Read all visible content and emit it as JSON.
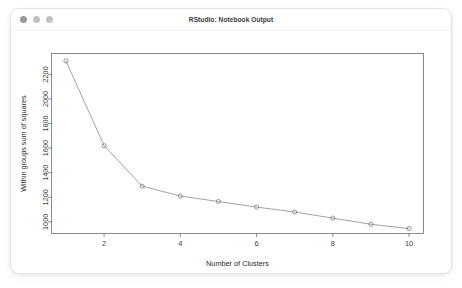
{
  "window": {
    "title": "RStudio: Notebook Output",
    "controls": [
      {
        "name": "close",
        "color": "#9a9a9e"
      },
      {
        "name": "minimize",
        "color": "#c2c2c6"
      },
      {
        "name": "maximize",
        "color": "#c2c2c6"
      }
    ]
  },
  "chart_data": {
    "type": "line",
    "title": "",
    "xlabel": "Number of Clusters",
    "ylabel": "Within groups sum of squares",
    "x": [
      1,
      2,
      3,
      4,
      5,
      6,
      7,
      8,
      9,
      10
    ],
    "values": [
      2310,
      1620,
      1290,
      1210,
      1165,
      1120,
      1080,
      1030,
      980,
      945
    ],
    "xlim": [
      0.62,
      10.38
    ],
    "ylim": [
      905,
      2370
    ],
    "xticks": [
      2,
      4,
      6,
      8,
      10
    ],
    "xtick_labels": [
      "2",
      "4",
      "6",
      "8",
      "10"
    ],
    "yticks": [
      1000,
      1200,
      1400,
      1600,
      1800,
      2000,
      2200
    ],
    "ytick_labels": [
      "1000",
      "1200",
      "1400",
      "1600",
      "1800",
      "2000",
      "2200"
    ],
    "grid": false,
    "legend": null,
    "marker": "open-circle",
    "line_color": "#7a7a7a",
    "marker_color": "#6e6e6e"
  }
}
